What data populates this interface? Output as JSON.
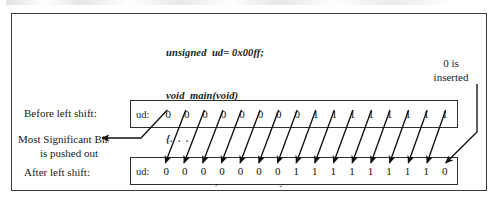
{
  "figure": {
    "title_text": "",
    "code": {
      "lines": [
        "unsigned  ud= 0x00ff;",
        "void  main(void)",
        "{",
        "ud << 1 ; ",
        "}"
      ],
      "line1": "unsigned  ud= 0x00ff;",
      "line2": "void  main(void)",
      "line3_brace": "{",
      "line3_dots": ". . .",
      "line4_code": "ud << 1 ; ",
      "line4_comment": "/* shift  left by 1 bit */",
      "line5_brace": "}"
    },
    "labels": {
      "before": "Before left shift:",
      "msb_line1": "Most Significant Bit",
      "msb_line2": "is pushed out",
      "after": "After left shift:",
      "inserted_line1": "0 is",
      "inserted_line2": "inserted"
    },
    "registers": {
      "before": {
        "name": "ud:",
        "bits": [
          "0",
          "0",
          "0",
          "0",
          "0",
          "0",
          "0",
          "0",
          "1",
          "1",
          "1",
          "1",
          "1",
          "1",
          "1",
          "1"
        ]
      },
      "after": {
        "name": "ud:",
        "bits": [
          "0",
          "0",
          "0",
          "0",
          "0",
          "0",
          "0",
          "1",
          "1",
          "1",
          "1",
          "1",
          "1",
          "1",
          "1",
          "0"
        ]
      }
    },
    "colors": {
      "frame": "#3a3a3a",
      "box": "#2e2e2e",
      "text": "#1a1a1a",
      "arrow": "#111111",
      "background": "#ffffff"
    }
  }
}
